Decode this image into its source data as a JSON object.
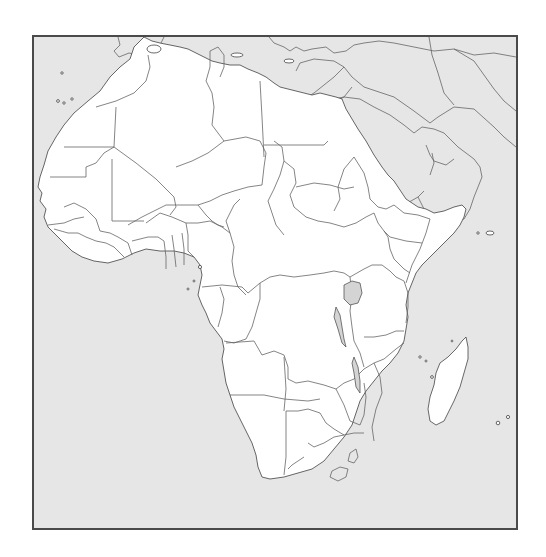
{
  "map": {
    "subject": "Blank outline map of Africa",
    "labels": [],
    "colors": {
      "ocean": "#e6e6e6",
      "land": "#ffffff",
      "outside_land": "#e6e6e6",
      "border": "#666666",
      "frame": "#4a4a4a",
      "lake": "#d4d4d4"
    },
    "frame": {
      "x": 32,
      "y": 35,
      "width": 486,
      "height": 495
    },
    "regions_shown": [
      "Africa",
      "Madagascar",
      "Arabian Peninsula",
      "Southern Europe (partial)",
      "Middle East (partial)"
    ],
    "lakes_shown": [
      "Lake Victoria",
      "Lake Tanganyika",
      "Lake Malawi"
    ]
  }
}
